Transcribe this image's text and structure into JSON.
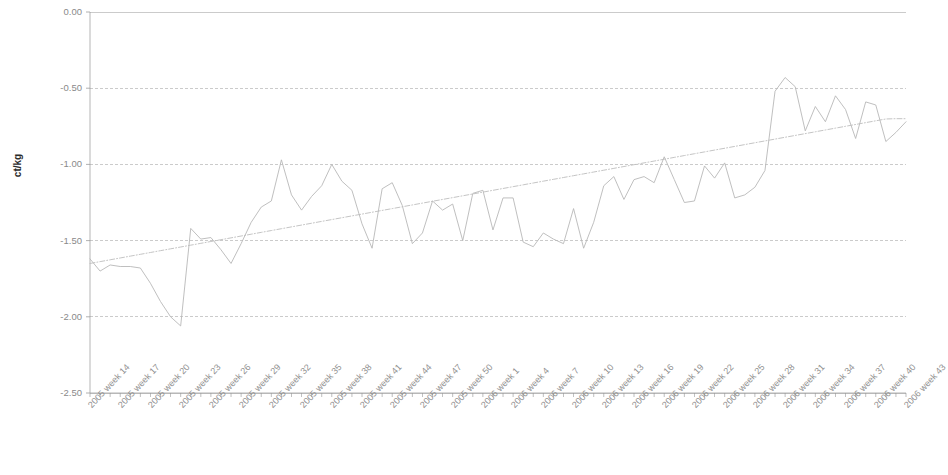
{
  "chart_data": {
    "type": "line",
    "title": "",
    "subtitle": "",
    "xlabel": "",
    "ylabel": "ct/kg",
    "ylim": [
      -2.5,
      0.0
    ],
    "ytick_labels": [
      "0.00",
      "-0.50",
      "-1.00",
      "-1.50",
      "-2.00",
      "-2.50"
    ],
    "ytick_values": [
      0.0,
      -0.5,
      -1.0,
      -1.5,
      -2.0,
      -2.5
    ],
    "grid": true,
    "gridlines_horizontal": true,
    "legend": "none",
    "legend_position": "none",
    "xtick_interval_weeks": 3,
    "x_tick_labels": [
      "2005 week 14",
      "2005 week 17",
      "2005 week 20",
      "2005 week 23",
      "2005 week 26",
      "2005 week 29",
      "2005 week 32",
      "2005 week 35",
      "2005 week 38",
      "2005 week 41",
      "2005 week 44",
      "2005 week 47",
      "2005 week 50",
      "2006 week 1",
      "2006 week 4",
      "2006 week 7",
      "2006 week 10",
      "2006 week 13",
      "2006 week 16",
      "2006 week 19",
      "2006 week 22",
      "2006 week 25",
      "2006 week 28",
      "2006 week 31",
      "2006 week 34",
      "2006 week 37",
      "2006 week 40",
      "2006 week 43"
    ],
    "x": [
      "2005 week 14",
      "2005 week 15",
      "2005 week 16",
      "2005 week 17",
      "2005 week 18",
      "2005 week 19",
      "2005 week 20",
      "2005 week 21",
      "2005 week 22",
      "2005 week 23",
      "2005 week 24",
      "2005 week 25",
      "2005 week 26",
      "2005 week 27",
      "2005 week 28",
      "2005 week 29",
      "2005 week 30",
      "2005 week 31",
      "2005 week 32",
      "2005 week 33",
      "2005 week 34",
      "2005 week 35",
      "2005 week 36",
      "2005 week 37",
      "2005 week 38",
      "2005 week 39",
      "2005 week 40",
      "2005 week 41",
      "2005 week 42",
      "2005 week 43",
      "2005 week 44",
      "2005 week 45",
      "2005 week 46",
      "2005 week 47",
      "2005 week 48",
      "2005 week 49",
      "2005 week 50",
      "2005 week 51",
      "2005 week 52",
      "2006 week 1",
      "2006 week 2",
      "2006 week 3",
      "2006 week 4",
      "2006 week 5",
      "2006 week 6",
      "2006 week 7",
      "2006 week 8",
      "2006 week 9",
      "2006 week 10",
      "2006 week 11",
      "2006 week 12",
      "2006 week 13",
      "2006 week 14",
      "2006 week 15",
      "2006 week 16",
      "2006 week 17",
      "2006 week 18",
      "2006 week 19",
      "2006 week 20",
      "2006 week 21",
      "2006 week 22",
      "2006 week 23",
      "2006 week 24",
      "2006 week 25",
      "2006 week 26",
      "2006 week 27",
      "2006 week 28",
      "2006 week 29",
      "2006 week 30",
      "2006 week 31",
      "2006 week 32",
      "2006 week 33",
      "2006 week 34",
      "2006 week 35",
      "2006 week 36",
      "2006 week 37",
      "2006 week 38",
      "2006 week 39",
      "2006 week 40",
      "2006 week 41",
      "2006 week 42",
      "2006 week 43"
    ],
    "series": [
      {
        "name": "price difference",
        "style": "solid",
        "color": "#b8b8b8",
        "values": [
          -1.62,
          -1.7,
          -1.66,
          -1.67,
          -1.67,
          -1.68,
          -1.78,
          -1.9,
          -2.0,
          -2.06,
          -1.42,
          -1.49,
          -1.48,
          -1.56,
          -1.65,
          -1.52,
          -1.38,
          -1.28,
          -1.24,
          -0.97,
          -1.2,
          -1.3,
          -1.21,
          -1.14,
          -1.0,
          -1.11,
          -1.17,
          -1.39,
          -1.55,
          -1.16,
          -1.12,
          -1.27,
          -1.52,
          -1.45,
          -1.24,
          -1.3,
          -1.26,
          -1.5,
          -1.19,
          -1.17,
          -1.43,
          -1.22,
          -1.22,
          -1.51,
          -1.54,
          -1.45,
          -1.49,
          -1.52,
          -1.29,
          -1.55,
          -1.38,
          -1.14,
          -1.08,
          -1.23,
          -1.1,
          -1.08,
          -1.12,
          -0.95,
          -1.1,
          -1.25,
          -1.24,
          -1.01,
          -1.09,
          -0.99,
          -1.22,
          -1.2,
          -1.15,
          -1.04,
          -0.52,
          -0.43,
          -0.49,
          -0.78,
          -0.62,
          -0.72,
          -0.55,
          -0.64,
          -0.83,
          -0.59,
          -0.61,
          -0.85,
          -0.79,
          -0.72
        ]
      },
      {
        "name": "linear trend",
        "style": "dashed",
        "color": "#bdbdbd",
        "values": [
          -1.65,
          -1.638,
          -1.626,
          -1.614,
          -1.602,
          -1.59,
          -1.578,
          -1.566,
          -1.554,
          -1.542,
          -1.53,
          -1.518,
          -1.506,
          -1.494,
          -1.482,
          -1.47,
          -1.458,
          -1.446,
          -1.434,
          -1.422,
          -1.41,
          -1.398,
          -1.386,
          -1.374,
          -1.362,
          -1.35,
          -1.338,
          -1.326,
          -1.314,
          -1.302,
          -1.29,
          -1.278,
          -1.266,
          -1.254,
          -1.242,
          -1.23,
          -1.218,
          -1.206,
          -1.194,
          -1.182,
          -1.17,
          -1.158,
          -1.146,
          -1.134,
          -1.122,
          -1.11,
          -1.098,
          -1.086,
          -1.074,
          -1.062,
          -1.05,
          -1.038,
          -1.026,
          -1.014,
          -1.002,
          -0.99,
          -0.978,
          -0.966,
          -0.954,
          -0.942,
          -0.93,
          -0.918,
          -0.906,
          -0.894,
          -0.882,
          -0.87,
          -0.858,
          -0.846,
          -0.834,
          -0.822,
          -0.81,
          -0.798,
          -0.786,
          -0.774,
          -0.762,
          -0.75,
          -0.738,
          -0.726,
          -0.714,
          -0.702,
          -0.7,
          -0.7
        ]
      }
    ]
  },
  "colors": {
    "grid": "#a9a9a9",
    "axis": "#9a9a9a",
    "data_line": "#b5b5b5",
    "trend_line": "#c0c0c0",
    "tick_text": "#8c8c8c",
    "axis_title": "#2b2b2b",
    "background": "#ffffff"
  }
}
